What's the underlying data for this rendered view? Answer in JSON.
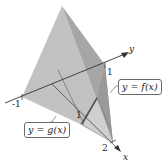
{
  "figure": {
    "type": "3d-solid",
    "axes": {
      "x": {
        "label": "x",
        "tick_labels": [
          "1",
          "2"
        ]
      },
      "y": {
        "label": "y",
        "tick_labels": [
          "-1",
          "1"
        ]
      }
    },
    "curve_labels": {
      "f": "y = f(x)",
      "g": "y = g(x)"
    },
    "colors": {
      "face_light": "#c4c4c4",
      "face_mid": "#b0b0b0",
      "face_dark": "#8e8e8e",
      "axis": "#333333"
    }
  }
}
